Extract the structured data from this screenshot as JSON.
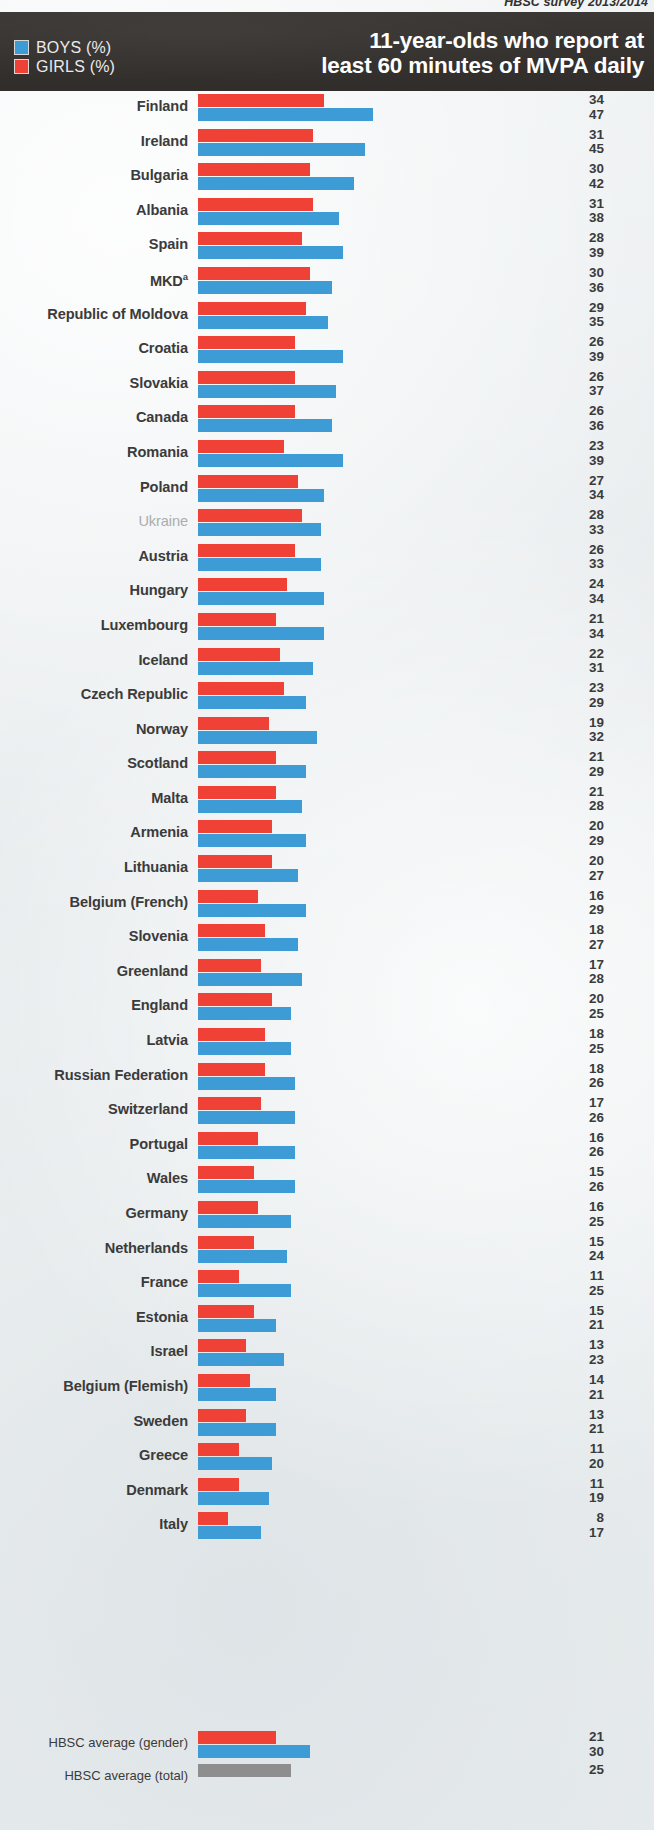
{
  "source_line": "HBSC survey 2013/2014",
  "header": {
    "title_line1": "11-year-olds who report at",
    "title_line2": "least 60 minutes of MVPA daily",
    "legend": [
      {
        "label": "BOYS (%)",
        "color": "#3d9bd6",
        "key": "boys"
      },
      {
        "label": "GIRLS (%)",
        "color": "#ef4136",
        "key": "girls"
      }
    ]
  },
  "averages": {
    "gender_label": "HBSC average (gender)",
    "total_label": "HBSC average (total)",
    "gender_girls": 21,
    "gender_boys": 30,
    "total": 25,
    "total_color": "#8e8e8e"
  },
  "footnote_marker": "a",
  "chart_data": {
    "type": "bar",
    "orientation": "horizontal",
    "title": "11-year-olds who report at least 60 minutes of MVPA daily",
    "subtitle": "HBSC survey 2013/2014",
    "xlabel": "",
    "ylabel": "",
    "xlim": [
      0,
      50
    ],
    "grid": false,
    "legend_position": "top-left",
    "value_labels": true,
    "sort": "descending by boys then girls",
    "categories": [
      "Finland",
      "Ireland",
      "Bulgaria",
      "Albania",
      "Spain",
      "MKD",
      "Republic of Moldova",
      "Croatia",
      "Slovakia",
      "Canada",
      "Romania",
      "Poland",
      "Ukraine",
      "Austria",
      "Hungary",
      "Luxembourg",
      "Iceland",
      "Czech Republic",
      "Norway",
      "Scotland",
      "Malta",
      "Armenia",
      "Lithuania",
      "Belgium (French)",
      "Slovenia",
      "Greenland",
      "England",
      "Latvia",
      "Russian Federation",
      "Switzerland",
      "Portugal",
      "Wales",
      "Germany",
      "Netherlands",
      "France",
      "Estonia",
      "Israel",
      "Belgium (Flemish)",
      "Sweden",
      "Greece",
      "Denmark",
      "Italy"
    ],
    "series": [
      {
        "name": "GIRLS (%)",
        "color": "#ef4136",
        "values": [
          34,
          31,
          30,
          31,
          28,
          30,
          29,
          26,
          26,
          26,
          23,
          27,
          28,
          26,
          24,
          21,
          22,
          23,
          19,
          21,
          21,
          20,
          20,
          16,
          18,
          17,
          20,
          18,
          18,
          17,
          16,
          15,
          16,
          15,
          11,
          15,
          13,
          14,
          13,
          11,
          11,
          8
        ]
      },
      {
        "name": "BOYS (%)",
        "color": "#3d9bd6",
        "values": [
          47,
          45,
          42,
          38,
          39,
          36,
          35,
          39,
          37,
          36,
          39,
          34,
          33,
          33,
          34,
          34,
          31,
          29,
          32,
          29,
          28,
          29,
          27,
          29,
          27,
          28,
          25,
          25,
          26,
          26,
          26,
          26,
          25,
          24,
          25,
          21,
          23,
          21,
          21,
          20,
          19,
          17
        ]
      }
    ],
    "annotations": [
      {
        "category": "MKD",
        "marker": "a",
        "note": "footnote marker on label"
      },
      {
        "category": "Ukraine",
        "style": "muted",
        "note": "label rendered in light grey, non-bold"
      }
    ],
    "averages": {
      "HBSC average (gender)": {
        "girls": 21,
        "boys": 30
      },
      "HBSC average (total)": 25
    }
  },
  "rows": [
    {
      "country": "Finland",
      "girls": 34,
      "boys": 47,
      "muted": false,
      "marker": ""
    },
    {
      "country": "Ireland",
      "girls": 31,
      "boys": 45,
      "muted": false,
      "marker": ""
    },
    {
      "country": "Bulgaria",
      "girls": 30,
      "boys": 42,
      "muted": false,
      "marker": ""
    },
    {
      "country": "Albania",
      "girls": 31,
      "boys": 38,
      "muted": false,
      "marker": ""
    },
    {
      "country": "Spain",
      "girls": 28,
      "boys": 39,
      "muted": false,
      "marker": ""
    },
    {
      "country": "MKD",
      "girls": 30,
      "boys": 36,
      "muted": false,
      "marker": "a"
    },
    {
      "country": "Republic of Moldova",
      "girls": 29,
      "boys": 35,
      "muted": false,
      "marker": ""
    },
    {
      "country": "Croatia",
      "girls": 26,
      "boys": 39,
      "muted": false,
      "marker": ""
    },
    {
      "country": "Slovakia",
      "girls": 26,
      "boys": 37,
      "muted": false,
      "marker": ""
    },
    {
      "country": "Canada",
      "girls": 26,
      "boys": 36,
      "muted": false,
      "marker": ""
    },
    {
      "country": "Romania",
      "girls": 23,
      "boys": 39,
      "muted": false,
      "marker": ""
    },
    {
      "country": "Poland",
      "girls": 27,
      "boys": 34,
      "muted": false,
      "marker": ""
    },
    {
      "country": "Ukraine",
      "girls": 28,
      "boys": 33,
      "muted": true,
      "marker": ""
    },
    {
      "country": "Austria",
      "girls": 26,
      "boys": 33,
      "muted": false,
      "marker": ""
    },
    {
      "country": "Hungary",
      "girls": 24,
      "boys": 34,
      "muted": false,
      "marker": ""
    },
    {
      "country": "Luxembourg",
      "girls": 21,
      "boys": 34,
      "muted": false,
      "marker": ""
    },
    {
      "country": "Iceland",
      "girls": 22,
      "boys": 31,
      "muted": false,
      "marker": ""
    },
    {
      "country": "Czech Republic",
      "girls": 23,
      "boys": 29,
      "muted": false,
      "marker": ""
    },
    {
      "country": "Norway",
      "girls": 19,
      "boys": 32,
      "muted": false,
      "marker": ""
    },
    {
      "country": "Scotland",
      "girls": 21,
      "boys": 29,
      "muted": false,
      "marker": ""
    },
    {
      "country": "Malta",
      "girls": 21,
      "boys": 28,
      "muted": false,
      "marker": ""
    },
    {
      "country": "Armenia",
      "girls": 20,
      "boys": 29,
      "muted": false,
      "marker": ""
    },
    {
      "country": "Lithuania",
      "girls": 20,
      "boys": 27,
      "muted": false,
      "marker": ""
    },
    {
      "country": "Belgium (French)",
      "girls": 16,
      "boys": 29,
      "muted": false,
      "marker": ""
    },
    {
      "country": "Slovenia",
      "girls": 18,
      "boys": 27,
      "muted": false,
      "marker": ""
    },
    {
      "country": "Greenland",
      "girls": 17,
      "boys": 28,
      "muted": false,
      "marker": ""
    },
    {
      "country": "England",
      "girls": 20,
      "boys": 25,
      "muted": false,
      "marker": ""
    },
    {
      "country": "Latvia",
      "girls": 18,
      "boys": 25,
      "muted": false,
      "marker": ""
    },
    {
      "country": "Russian Federation",
      "girls": 18,
      "boys": 26,
      "muted": false,
      "marker": ""
    },
    {
      "country": "Switzerland",
      "girls": 17,
      "boys": 26,
      "muted": false,
      "marker": ""
    },
    {
      "country": "Portugal",
      "girls": 16,
      "boys": 26,
      "muted": false,
      "marker": ""
    },
    {
      "country": "Wales",
      "girls": 15,
      "boys": 26,
      "muted": false,
      "marker": ""
    },
    {
      "country": "Germany",
      "girls": 16,
      "boys": 25,
      "muted": false,
      "marker": ""
    },
    {
      "country": "Netherlands",
      "girls": 15,
      "boys": 24,
      "muted": false,
      "marker": ""
    },
    {
      "country": "France",
      "girls": 11,
      "boys": 25,
      "muted": false,
      "marker": ""
    },
    {
      "country": "Estonia",
      "girls": 15,
      "boys": 21,
      "muted": false,
      "marker": ""
    },
    {
      "country": "Israel",
      "girls": 13,
      "boys": 23,
      "muted": false,
      "marker": ""
    },
    {
      "country": "Belgium (Flemish)",
      "girls": 14,
      "boys": 21,
      "muted": false,
      "marker": ""
    },
    {
      "country": "Sweden",
      "girls": 13,
      "boys": 21,
      "muted": false,
      "marker": ""
    },
    {
      "country": "Greece",
      "girls": 11,
      "boys": 20,
      "muted": false,
      "marker": ""
    },
    {
      "country": "Denmark",
      "girls": 11,
      "boys": 19,
      "muted": false,
      "marker": ""
    },
    {
      "country": "Italy",
      "girls": 8,
      "boys": 17,
      "muted": false,
      "marker": ""
    }
  ]
}
